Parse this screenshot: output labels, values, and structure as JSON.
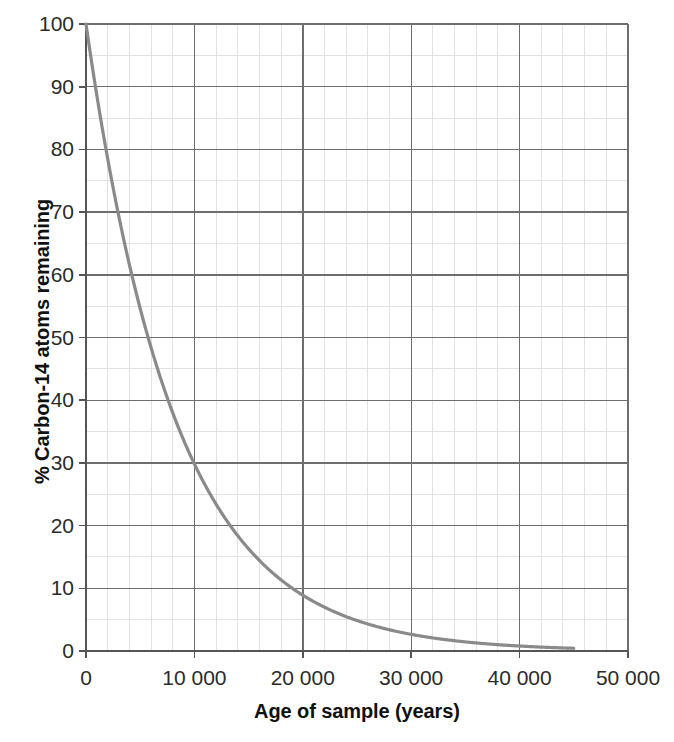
{
  "chart_data": {
    "type": "line",
    "title": "",
    "xlabel": "Age of sample (years)",
    "ylabel": "% Carbon-14 atoms remaining",
    "xlim": [
      0,
      50000
    ],
    "ylim": [
      0,
      100
    ],
    "grid": "major and minor gridlines on both axes",
    "legend": "none",
    "series_name": "Carbon-14 remaining",
    "curve_color": "#8a8a8a",
    "grid_major_color": "#6e6e6e",
    "grid_minor_color": "#e2e2e2",
    "axis_color": "#555555",
    "half_life_years": 5730,
    "curve_end_x": 45000,
    "x_ticks": [
      0,
      10000,
      20000,
      30000,
      40000,
      50000
    ],
    "x_tick_labels": [
      "0",
      "10 000",
      "20 000",
      "30 000",
      "40 000",
      "50 000"
    ],
    "x_minor_step": 2000,
    "y_ticks": [
      0,
      10,
      20,
      30,
      40,
      50,
      60,
      70,
      80,
      90,
      100
    ],
    "y_tick_labels": [
      "0",
      "10",
      "20",
      "30",
      "40",
      "50",
      "60",
      "70",
      "80",
      "90",
      "100"
    ],
    "y_minor_step": 5,
    "x": [
      0,
      1000,
      2000,
      3000,
      4000,
      5000,
      5730,
      6000,
      7000,
      8000,
      9000,
      10000,
      11000,
      12000,
      13000,
      14000,
      15000,
      16000,
      17000,
      18000,
      19000,
      20000,
      22000,
      24000,
      26000,
      28000,
      30000,
      32000,
      34000,
      36000,
      38000,
      40000,
      42000,
      45000
    ],
    "y": [
      100,
      88.6,
      78.5,
      69.6,
      61.6,
      54.6,
      50,
      48.4,
      42.8,
      37.9,
      33.6,
      29.8,
      26.4,
      23.4,
      20.7,
      18.3,
      16.2,
      14.4,
      12.8,
      11.3,
      10.0,
      8.9,
      6.9,
      5.4,
      4.2,
      3.3,
      2.6,
      2.1,
      1.6,
      1.3,
      1.0,
      0.8,
      0.6,
      0.4
    ]
  },
  "labels": {
    "xlabel": "Age of sample (years)",
    "ylabel": "% Carbon-14 atoms remaining"
  }
}
